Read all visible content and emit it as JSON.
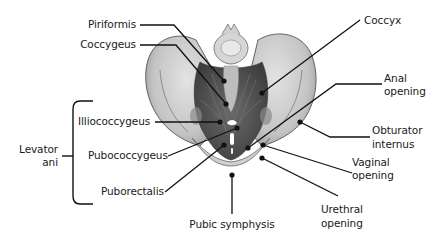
{
  "diagram": {
    "labels": {
      "piriformis": "Piriformis",
      "coccygeus": "Coccygeus",
      "coccyx": "Coccyx",
      "illiococcygeus": "Illiococcygeus",
      "pubococcygeus": "Pubococcygeus",
      "puborectalis": "Puborectalis",
      "levator_line1": "Levator",
      "levator_line2": "ani",
      "anal_line1": "Anal",
      "anal_line2": "opening",
      "obturator_line1": "Obturator",
      "obturator_line2": "internus",
      "vaginal_line1": "Vaginal",
      "vaginal_line2": "opening",
      "urethral_line1": "Urethral",
      "urethral_line2": "opening",
      "pubic_symphysis": "Pubic symphysis"
    },
    "group": {
      "name": "Levator ani",
      "members": [
        "Illiococcygeus",
        "Pubococcygeus",
        "Puborectalis"
      ]
    },
    "colors": {
      "bone_light": "#d9d9d9",
      "bone_mid": "#b8b8b8",
      "bone_dark": "#8a8a8a",
      "muscle": "#5e5e5e",
      "muscle_dark": "#454545",
      "leader_line": "#111111",
      "text": "#1a1a1a"
    }
  }
}
